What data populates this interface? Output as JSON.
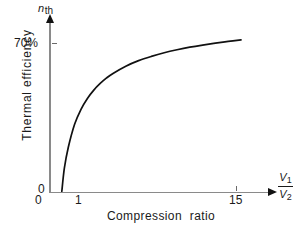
{
  "chart_data": {
    "type": "line",
    "title": "",
    "xlabel": "Compression  ratio",
    "ylabel": "Thermal efficiency",
    "y_symbol_main": "n",
    "y_symbol_sub": "th",
    "x_symbol_numerator": "V",
    "x_symbol_numerator_sub": "1",
    "x_symbol_denominator": "V",
    "x_symbol_denominator_sub": "2",
    "xlim": [
      0,
      17.5
    ],
    "ylim": [
      0,
      78
    ],
    "x_ticks": [
      "0",
      "1",
      "15"
    ],
    "x_tick_values": [
      0,
      1,
      15
    ],
    "y_ticks": [
      "0",
      "70%"
    ],
    "y_tick_values": [
      0,
      70
    ],
    "grid": false,
    "legend": false,
    "series": [
      {
        "name": "Otto cycle thermal efficiency",
        "x": [
          1.0,
          1.2,
          1.5,
          2.0,
          2.5,
          3.0,
          3.5,
          4.0,
          4.5,
          5.0,
          6.0,
          7.0,
          8.0,
          9.0,
          10.0,
          11.0,
          12.0,
          13.0,
          14.0,
          15.0
        ],
        "y": [
          0.0,
          10.9,
          20.5,
          31.5,
          38.5,
          43.6,
          47.5,
          50.6,
          53.2,
          55.3,
          58.7,
          61.3,
          63.3,
          65.0,
          66.4,
          67.6,
          68.6,
          69.5,
          70.3,
          71.0
        ]
      }
    ],
    "curve_color": "#111111",
    "axis_color": "#8a8a8a",
    "text_color": "#1a1a1a",
    "background_color": "#ffffff"
  },
  "axes": {
    "y_tick_70_label": "70%",
    "y_origin_label": "0",
    "x_origin_label": "0",
    "x_tick_1_label": "1",
    "x_tick_15_label": "15",
    "y_title": "Thermal efficiency",
    "x_title": "Compression  ratio"
  }
}
